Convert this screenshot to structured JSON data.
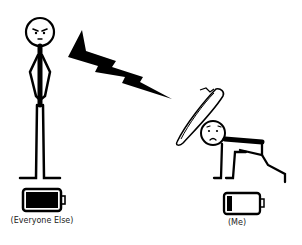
{
  "comic": {
    "left_figure": {
      "label": "(Everyone Else)",
      "expression": "angry",
      "pose": "standing, hands on hips",
      "battery_level": "full"
    },
    "right_figure": {
      "label": "(Me)",
      "expression": "worried",
      "pose": "crouched on all fours under shield",
      "battery_level": "low"
    },
    "lightning_bolt": {
      "icon": "lightning-bolt-icon",
      "color": "#000000"
    },
    "shield": {
      "icon": "shield-icon"
    }
  },
  "colors": {
    "ink": "#000000",
    "background": "#ffffff"
  }
}
